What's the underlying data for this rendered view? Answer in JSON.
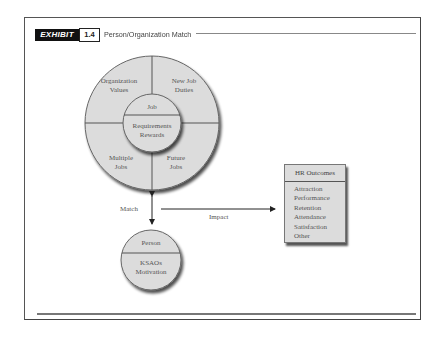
{
  "exhibit": {
    "tag": "EXHIBIT",
    "number": "1.4",
    "title": "Person/Organization Match"
  },
  "organization_circle": {
    "quadrants": {
      "top_left": [
        "Organization",
        "Values"
      ],
      "top_right": [
        "New Job",
        "Duties"
      ],
      "bottom_left": [
        "Multiple",
        "Jobs"
      ],
      "bottom_right": [
        "Future",
        "Jobs"
      ]
    },
    "inner": {
      "top": "Job",
      "bottom": [
        "Requirements",
        "Rewards"
      ]
    }
  },
  "person_circle": {
    "top": "Person",
    "bottom": [
      "KSAOs",
      "Motivation"
    ]
  },
  "arrows": {
    "match_label": "Match",
    "impact_label": "Impact"
  },
  "hr_outcomes": {
    "title": "HR Outcomes",
    "items": [
      "Attraction",
      "Performance",
      "Retention",
      "Attendance",
      "Satisfaction",
      "Other"
    ]
  },
  "colors": {
    "fill": "#dcdcdc",
    "stroke": "#555555",
    "shadow": "#555555",
    "tag_bg": "#111111"
  }
}
